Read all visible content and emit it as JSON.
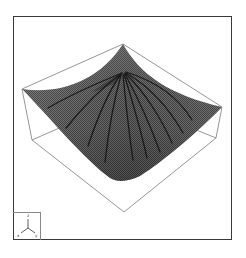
{
  "figure": {
    "type": "3d-surface-plot",
    "colors": {
      "frame": "#3a3a3a",
      "box_lines": "#8a8a8a",
      "surface_fill": "#6e6e6e",
      "surface_light": "#9a9a9a",
      "surface_dark": "#3c3c3c",
      "field_lines": "#1a1a1a",
      "background": "#ffffff"
    },
    "bounding_box": {
      "top_apex": [
        123,
        44
      ],
      "left_corner": [
        22,
        89
      ],
      "right_corner": [
        222,
        107
      ],
      "bottom_corner": [
        124,
        212
      ],
      "left_bottom": [
        32,
        140
      ],
      "right_bottom": [
        216,
        138
      ],
      "back_bottom": [
        123,
        100
      ]
    },
    "surface": {
      "peak": [
        123,
        44
      ],
      "inner_convergence": [
        122,
        73
      ],
      "lowest_point": [
        123,
        181
      ],
      "left_edge": [
        22,
        89
      ],
      "right_edge": [
        222,
        107
      ]
    },
    "field_lines": [
      {
        "end": [
          48,
          108
        ]
      },
      {
        "end": [
          66,
          128
        ]
      },
      {
        "end": [
          88,
          146
        ]
      },
      {
        "end": [
          105,
          162
        ]
      },
      {
        "end": [
          133,
          160
        ]
      },
      {
        "end": [
          147,
          158
        ]
      },
      {
        "end": [
          160,
          152
        ]
      },
      {
        "end": [
          172,
          143
        ]
      },
      {
        "end": [
          183,
          133
        ]
      },
      {
        "end": [
          192,
          120
        ]
      }
    ],
    "axis_triad": {
      "labels": [
        "z",
        "x",
        "y"
      ]
    }
  }
}
